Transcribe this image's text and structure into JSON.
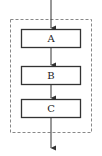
{
  "diagram": {
    "type": "flow",
    "container": {
      "style": "dashed",
      "color": "#888888"
    },
    "nodes": [
      {
        "id": "A",
        "label": "A"
      },
      {
        "id": "B",
        "label": "B"
      },
      {
        "id": "C",
        "label": "C"
      }
    ],
    "edges": [
      {
        "from": "input",
        "to": "A"
      },
      {
        "from": "A",
        "to": "B"
      },
      {
        "from": "B",
        "to": "C"
      },
      {
        "from": "C",
        "to": "output"
      }
    ],
    "colors": {
      "stroke": "#333333",
      "dashed": "#888888",
      "background": "#ffffff"
    }
  }
}
